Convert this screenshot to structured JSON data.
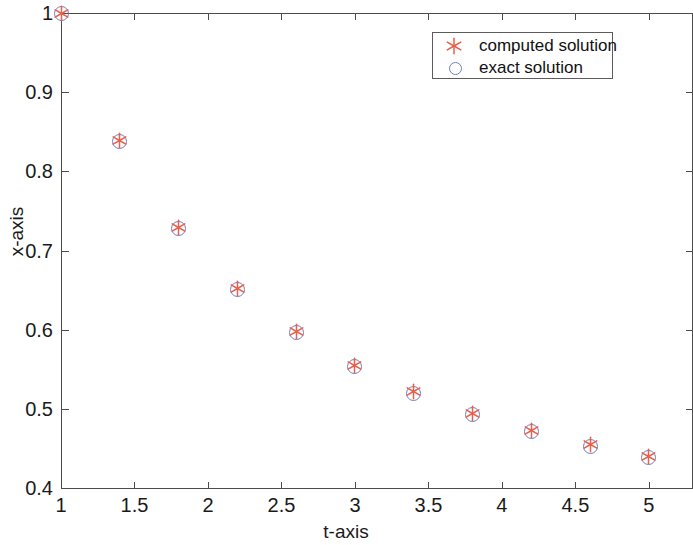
{
  "chart_data": {
    "type": "scatter",
    "title": "",
    "xlabel": "t-axis",
    "ylabel": "x-axis",
    "xlim": [
      1,
      5.3
    ],
    "ylim": [
      0.4,
      1.0
    ],
    "grid": false,
    "legend_position": "top-right",
    "xticks": [
      1,
      1.5,
      2,
      2.5,
      3,
      3.5,
      4,
      4.5,
      5
    ],
    "xticklabels": [
      "1",
      "1.5",
      "2",
      "2.5",
      "3",
      "3.5",
      "4",
      "4.5",
      "5"
    ],
    "yticks": [
      0.4,
      0.5,
      0.6,
      0.7,
      0.8,
      0.9,
      1
    ],
    "yticklabels": [
      "0.4",
      "0.5",
      "0.6",
      "0.7",
      "0.8",
      "0.9",
      "1"
    ],
    "x": [
      1,
      1.4,
      1.8,
      2.2,
      2.6,
      3.0,
      3.4,
      3.8,
      4.2,
      4.6,
      5.0
    ],
    "series": [
      {
        "name": "computed solution",
        "marker": "asterisk",
        "color": "#e8604c",
        "values": [
          1.0,
          0.8395,
          0.7295,
          0.6525,
          0.5975,
          0.5545,
          0.5215,
          0.4945,
          0.4725,
          0.4545,
          0.4395
        ]
      },
      {
        "name": "exact solution",
        "marker": "circle",
        "color": "#6f7fbf",
        "values": [
          1.0,
          0.838,
          0.728,
          0.651,
          0.596,
          0.553,
          0.52,
          0.493,
          0.471,
          0.453,
          0.438
        ]
      }
    ]
  },
  "axes": {
    "x_title": "t-axis",
    "y_title": "x-axis"
  },
  "legend": {
    "entries": [
      {
        "label": "computed solution",
        "marker": "asterisk-icon",
        "color": "#e8604c"
      },
      {
        "label": "exact solution",
        "marker": "circle-icon",
        "color": "#6f7fbf"
      }
    ]
  }
}
